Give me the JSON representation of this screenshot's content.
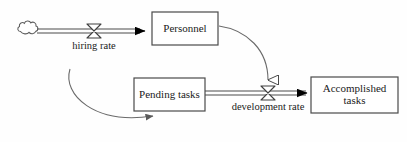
{
  "diagram": {
    "type": "system-dynamics-stock-and-flow",
    "background_color": "#fefefe",
    "line_color": "#3a3a3a",
    "text_color": "#1a1a1a",
    "arrow_fill": "#000000",
    "stocks": [
      {
        "id": "personnel",
        "label": "Personnel",
        "x": 152,
        "y": 12,
        "width": 66,
        "height": 33
      },
      {
        "id": "pending-tasks",
        "label": "Pending tasks",
        "x": 134,
        "y": 78,
        "width": 71,
        "height": 33
      },
      {
        "id": "accomplished-tasks",
        "label": "Accomplished\ntasks",
        "x": 311,
        "y": 77,
        "width": 87,
        "height": 36
      }
    ],
    "flows": [
      {
        "id": "hiring-rate",
        "label": "hiring rate",
        "valve_x": 94,
        "valve_y": 31,
        "label_x": 94,
        "label_y": 41,
        "source": "cloud-source",
        "target": "personnel"
      },
      {
        "id": "development-rate",
        "label": "development rate",
        "valve_x": 268,
        "valve_y": 93,
        "label_x": 268,
        "label_y": 102,
        "source": "pending-tasks",
        "target": "accomplished-tasks"
      }
    ],
    "sources": [
      {
        "id": "cloud-source",
        "x": 28,
        "y": 31
      }
    ],
    "connectors": [
      {
        "id": "personnel-to-development-rate",
        "from": "personnel",
        "to": "development-rate"
      },
      {
        "id": "feedback-to-pending-tasks",
        "from": "external",
        "to": "pending-tasks"
      }
    ]
  }
}
